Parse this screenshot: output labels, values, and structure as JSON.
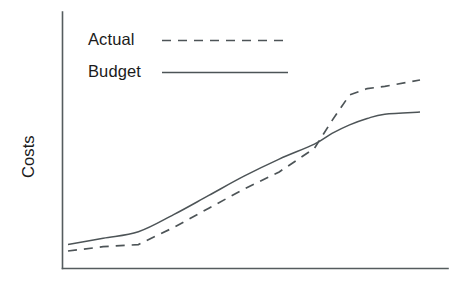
{
  "chart_data": {
    "type": "line",
    "title": "",
    "subtitle": "",
    "xlabel": "",
    "ylabel": "Costs",
    "grid": false,
    "axes": {
      "x_axis_visible": true,
      "y_axis_visible": true,
      "x_tick_labels": [],
      "y_tick_labels": [],
      "xlim": [
        0,
        100
      ],
      "ylim": [
        0,
        100
      ],
      "note": "Unlabeled schematic axes; values are relative/illustrative"
    },
    "legend": {
      "position": "top-left-inside",
      "entries": [
        {
          "label": "Actual",
          "style": "dashed",
          "color": "#4d5457"
        },
        {
          "label": "Budget",
          "style": "solid",
          "color": "#4d5457"
        }
      ]
    },
    "x": [
      0,
      10,
      20,
      30,
      40,
      50,
      60,
      70,
      75,
      80,
      85,
      90,
      100
    ],
    "series": [
      {
        "name": "Actual",
        "style": "dashed",
        "color": "#4d5457",
        "values": [
          7,
          9,
          10,
          18,
          27,
          36,
          44,
          55,
          68,
          80,
          83,
          84,
          87
        ]
      },
      {
        "name": "Budget",
        "style": "solid",
        "color": "#4d5457",
        "values": [
          10,
          13,
          16,
          24,
          33,
          42,
          50,
          57,
          62,
          66,
          69,
          71,
          72
        ]
      }
    ],
    "annotations": [
      {
        "text": "Actual crosses above Budget near the right of the range",
        "x": 72,
        "y": 58
      }
    ],
    "colors": {
      "axis": "#555c5e",
      "line": "#4d5457",
      "text": "#1b1b1b",
      "background": "#ffffff"
    }
  },
  "legend": {
    "actual_label": "Actual",
    "budget_label": "Budget"
  },
  "axis": {
    "y_title": "Costs"
  }
}
